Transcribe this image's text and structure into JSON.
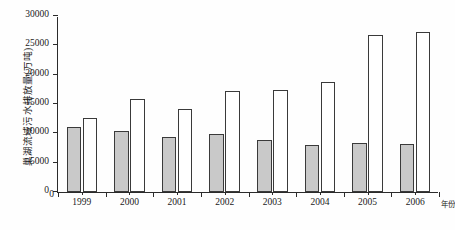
{
  "chart_data": {
    "type": "bar",
    "title": "",
    "xlabel": "年份",
    "ylabel": "巢湖流域污水排放量(万吨)",
    "categories": [
      "1999",
      "2000",
      "2001",
      "2002",
      "2003",
      "2004",
      "2005",
      "2006"
    ],
    "series": [
      {
        "name": "series-filled-gray",
        "style": "gray-filled",
        "color": "#c9c9c9",
        "values": [
          11000,
          10400,
          9300,
          9900,
          8900,
          8000,
          8400,
          8200
        ]
      },
      {
        "name": "series-open-white",
        "style": "white-outline",
        "color": "#ffffff",
        "values": [
          12700,
          15900,
          14200,
          17200,
          17400,
          18800,
          26700,
          27300
        ]
      }
    ],
    "ylim": [
      0,
      30000
    ],
    "ytick_values": [
      0,
      5000,
      10000,
      15000,
      20000,
      25000,
      30000
    ],
    "ytick_labels": [
      "0",
      "5000",
      "10000",
      "15000",
      "20000",
      "25000",
      "30000"
    ],
    "grid": false,
    "legend": false,
    "legend_position": "none",
    "bar_edge_color": "#3a3a3a",
    "axis_color": "#2b2b2b"
  }
}
